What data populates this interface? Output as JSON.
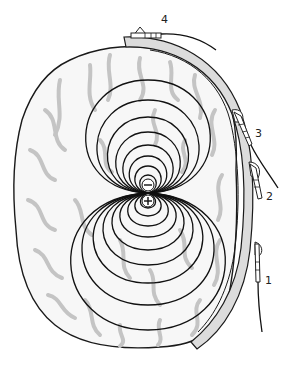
{
  "diagram": {
    "title": "",
    "colors": {
      "outline": "#1a1a1a",
      "sulci": "#c4c4c4",
      "band_fill": "#dcdcdc",
      "background": "#ffffff"
    },
    "dipole": {
      "negative_label": "−",
      "positive_label": "+"
    },
    "electrodes": [
      {
        "id": 1,
        "label": "1"
      },
      {
        "id": 2,
        "label": "2"
      },
      {
        "id": 3,
        "label": "3"
      },
      {
        "id": 4,
        "label": "4"
      }
    ]
  }
}
